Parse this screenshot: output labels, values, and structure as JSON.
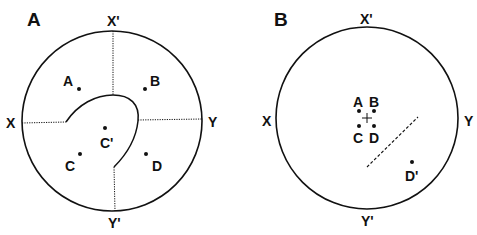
{
  "panels": [
    {
      "label": "A",
      "axes": {
        "top": "X'",
        "bottom": "Y'",
        "left": "X",
        "right": "Y"
      },
      "points": [
        {
          "label": "A"
        },
        {
          "label": "B"
        },
        {
          "label": "C'"
        },
        {
          "label": "C"
        },
        {
          "label": "D"
        }
      ]
    },
    {
      "label": "B",
      "axes": {
        "top": "X'",
        "bottom": "Y'",
        "left": "X",
        "right": "Y"
      },
      "points": [
        {
          "label": "A"
        },
        {
          "label": "B"
        },
        {
          "label": "C"
        },
        {
          "label": "D"
        },
        {
          "label": "D'"
        }
      ]
    }
  ],
  "colors": {
    "stroke": "#111111",
    "background": "#ffffff"
  }
}
